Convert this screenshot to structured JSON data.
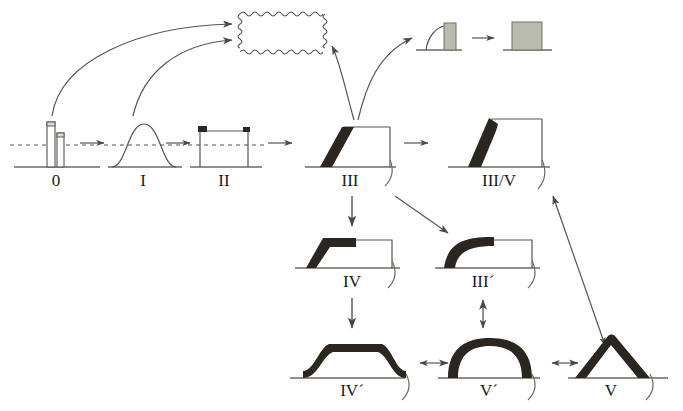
{
  "figure": {
    "background_color": "#ffffff",
    "line_color": "#4a4a44",
    "thick_fill_color": "#2b2620",
    "gray_fill_color": "#b3b5a8",
    "dashed_line_color": "#8f8f84"
  },
  "stages": [
    {
      "id": "stage-0",
      "label": "0",
      "x": 58,
      "y": 185,
      "description": "two narrow vertical bars on baseline with dashed level line"
    },
    {
      "id": "stage-I",
      "label": "I",
      "x": 140,
      "y": 185,
      "description": "smooth bell-shaped hump on baseline with dashed level line"
    },
    {
      "id": "stage-II",
      "label": "II",
      "x": 223,
      "y": 185,
      "description": "open rectangle with small black corner marks and dashed level line"
    },
    {
      "id": "stage-III",
      "label": "III",
      "x": 350,
      "y": 185,
      "description": "trapezoid outline with thick black slanted band on the left flank"
    },
    {
      "id": "stage-III-V",
      "label": "III/V",
      "x": 499,
      "y": 185,
      "description": "outline with thick black steep triangular spike on the left flank"
    },
    {
      "id": "stage-IV",
      "label": "IV",
      "x": 355,
      "y": 285,
      "description": "outline with thick black bent stepped band on the left"
    },
    {
      "id": "stage-III-pr",
      "label": "III´",
      "x": 483,
      "y": 285,
      "description": "outline with thick black concave curved band on the left"
    },
    {
      "id": "stage-IV-pr",
      "label": "IV´",
      "x": 355,
      "y": 385,
      "description": "thick black flat-topped trapezoidal cap"
    },
    {
      "id": "stage-V-pr",
      "label": "V´",
      "x": 490,
      "y": 385,
      "description": "thick black rounded dome arch"
    },
    {
      "id": "stage-V",
      "label": "V",
      "x": 610,
      "y": 385,
      "description": "thick black triangular peak"
    }
  ],
  "insets": {
    "wavy_box": {
      "id": "wavy-box",
      "description": "empty rectangle drawn with wavy / zigzag borders",
      "x": 240,
      "y": 14,
      "width": 85,
      "height": 38
    },
    "gray_pair": {
      "id": "gray-inset",
      "description": "small curve with gray filled rectangle, arrow, then larger gray filled square",
      "left_x": 420,
      "right_x": 500,
      "y": 18
    }
  },
  "connectors": [
    {
      "id": "arrow-0-to-I",
      "type": "straight",
      "label": "→"
    },
    {
      "id": "arrow-I-to-II",
      "type": "straight",
      "label": "→"
    },
    {
      "id": "arrow-II-to-III",
      "type": "straight",
      "label": "→"
    },
    {
      "id": "arrow-III-to-III-V",
      "type": "straight",
      "label": "→"
    },
    {
      "id": "arrow-0-to-wavy",
      "type": "curved",
      "label": ""
    },
    {
      "id": "arrow-II-to-wavy",
      "type": "curved",
      "label": ""
    },
    {
      "id": "arrow-III-to-wavy",
      "type": "curved",
      "label": ""
    },
    {
      "id": "arrow-III-to-gray",
      "type": "curved",
      "label": ""
    },
    {
      "id": "arrow-gray-pair",
      "type": "straight",
      "label": "→"
    },
    {
      "id": "arrow-III-to-IV",
      "type": "vertical",
      "label": "↓"
    },
    {
      "id": "arrow-III-to-III-pr",
      "type": "diagonal",
      "label": "↘"
    },
    {
      "id": "arrow-IV-to-IV-pr",
      "type": "vertical",
      "label": "↓"
    },
    {
      "id": "arrow-IV-pr-V-pr",
      "type": "double",
      "label": "↔"
    },
    {
      "id": "arrow-V-pr-V",
      "type": "double",
      "label": "↔"
    },
    {
      "id": "arrow-III-pr-V-pr",
      "type": "double",
      "label": "↕"
    },
    {
      "id": "arrow-V-to-III-V",
      "type": "double-diagonal",
      "label": ""
    }
  ]
}
